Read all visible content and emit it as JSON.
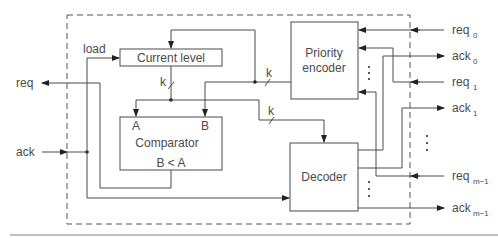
{
  "diagram": {
    "blocks": {
      "current_level": "Current level",
      "priority_encoder_line1": "Priority",
      "priority_encoder_line2": "encoder",
      "comparator": "Comparator",
      "comparator_in_a": "A",
      "comparator_in_b": "B",
      "comparator_out": "B < A",
      "decoder": "Decoder"
    },
    "signals": {
      "load": "load",
      "req": "req",
      "ack": "ack",
      "bus_width": "k"
    },
    "ports_right": [
      {
        "base": "req",
        "sub": "0"
      },
      {
        "base": "ack",
        "sub": "0"
      },
      {
        "base": "req",
        "sub": "1"
      },
      {
        "base": "ack",
        "sub": "1"
      },
      {
        "base": "req",
        "sub": "m−1"
      },
      {
        "base": "ack",
        "sub": "m−1"
      }
    ],
    "ellipsis": "⋮"
  }
}
